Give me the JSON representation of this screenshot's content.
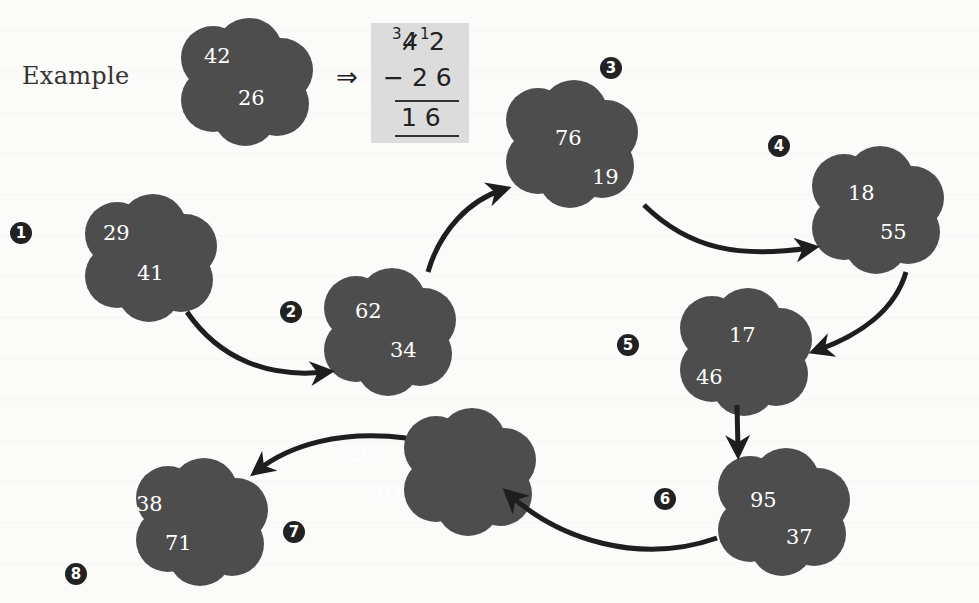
{
  "example": {
    "label": "Example",
    "implies_symbol": "⇒",
    "top_number": 42,
    "bottom_number": 26,
    "work": {
      "borrow_tens": "3",
      "struck_digit": "4",
      "borrow_ones": "1",
      "ones_digit": "2",
      "minus_line": "− 2 6",
      "result": "1 6"
    }
  },
  "problems": [
    {
      "badge": "1",
      "top": 29,
      "bottom": 41
    },
    {
      "badge": "2",
      "top": 62,
      "bottom": 34
    },
    {
      "badge": "3",
      "top": 76,
      "bottom": 19
    },
    {
      "badge": "4",
      "top": 18,
      "bottom": 55
    },
    {
      "badge": "5",
      "top": 17,
      "bottom": 46
    },
    {
      "badge": "6",
      "top": 95,
      "bottom": 37
    },
    {
      "badge": "7",
      "top": 26,
      "bottom": 61
    },
    {
      "badge": "8",
      "top": 38,
      "bottom": 71
    }
  ],
  "colors": {
    "cloud": "#4d4d4d",
    "arrow": "#1e1e1e",
    "badge": "#222222",
    "work_box": "#dcdcdc"
  }
}
